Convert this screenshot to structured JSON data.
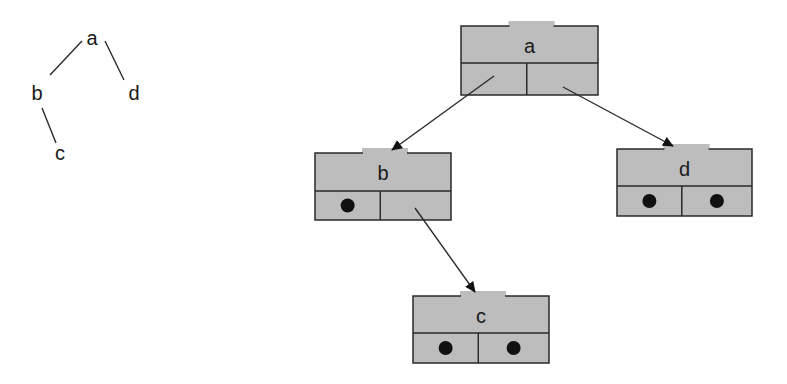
{
  "simple_tree": {
    "nodes": [
      {
        "id": "a",
        "label": "a",
        "x": 92,
        "y": 45
      },
      {
        "id": "b",
        "label": "b",
        "x": 37,
        "y": 100
      },
      {
        "id": "d",
        "label": "d",
        "x": 134,
        "y": 100
      },
      {
        "id": "c",
        "label": "c",
        "x": 60,
        "y": 160
      }
    ],
    "edges": [
      {
        "from": "a",
        "to": "b",
        "x1": 82,
        "y1": 41,
        "x2": 50,
        "y2": 75
      },
      {
        "from": "a",
        "to": "d",
        "x1": 105,
        "y1": 41,
        "x2": 124,
        "y2": 80
      },
      {
        "from": "b",
        "to": "c",
        "x1": 42,
        "y1": 108,
        "x2": 56,
        "y2": 143
      }
    ]
  },
  "linked_tree": {
    "colors": {
      "node_fill": "#bdbdbd",
      "stroke": "#2a2a2a",
      "pointer": "#111111"
    },
    "nodes": [
      {
        "id": "a",
        "label": "a",
        "x": 461,
        "y": 26,
        "w": 137,
        "h": 69,
        "split": 37,
        "left": "pointer",
        "right": "pointer"
      },
      {
        "id": "b",
        "label": "b",
        "x": 315,
        "y": 153,
        "w": 136,
        "h": 67,
        "split": 38,
        "left": "null",
        "right": "pointer"
      },
      {
        "id": "d",
        "label": "d",
        "x": 617,
        "y": 149,
        "w": 135,
        "h": 67,
        "split": 37,
        "left": "null",
        "right": "null"
      },
      {
        "id": "c",
        "label": "c",
        "x": 413,
        "y": 296,
        "w": 136,
        "h": 67,
        "split": 37,
        "left": "null",
        "right": "null"
      }
    ],
    "arrows": [
      {
        "from": "a.left",
        "to": "b",
        "x1": 494,
        "y1": 76,
        "x2": 392,
        "y2": 150
      },
      {
        "from": "a.right",
        "to": "d",
        "x1": 563,
        "y1": 87,
        "x2": 673,
        "y2": 146
      },
      {
        "from": "b.right",
        "to": "c",
        "x1": 415,
        "y1": 208,
        "x2": 475,
        "y2": 292
      }
    ]
  }
}
